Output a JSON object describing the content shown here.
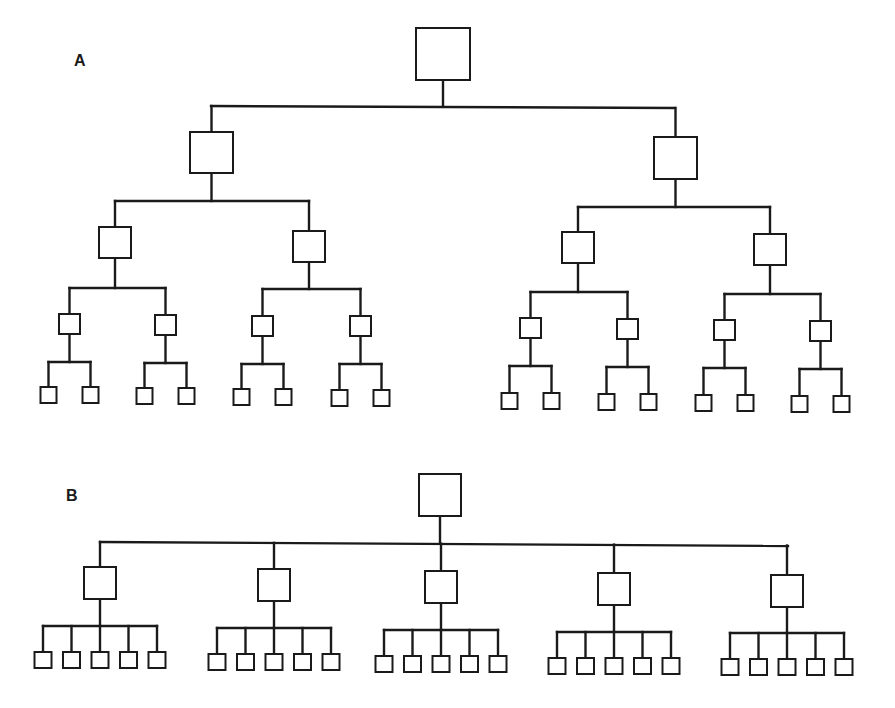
{
  "figure": {
    "panels": [
      {
        "label": "A",
        "structure": "binary tree, 5 levels",
        "levels": 5,
        "span_of_control": 2,
        "node_counts_per_level": [
          1,
          2,
          4,
          8,
          16
        ]
      },
      {
        "label": "B",
        "structure": "flat tree, 3 levels",
        "levels": 3,
        "span_of_control": 5,
        "node_counts_per_level": [
          1,
          5,
          25
        ]
      }
    ]
  },
  "colors": {
    "line": "#1a1a1a",
    "box_fill": "#ffffff",
    "background": "#ffffff"
  }
}
